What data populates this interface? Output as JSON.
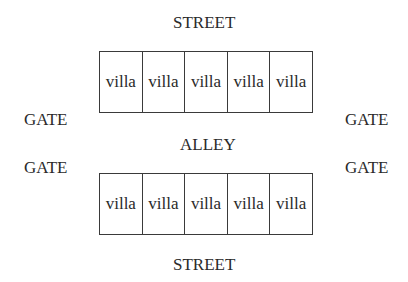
{
  "labels": {
    "street_top": "STREET",
    "street_bottom": "STREET",
    "alley": "ALLEY",
    "gate_top_left": "GATE",
    "gate_top_right": "GATE",
    "gate_bottom_left": "GATE",
    "gate_bottom_right": "GATE"
  },
  "rows": {
    "top": [
      "villa",
      "villa",
      "villa",
      "villa",
      "villa"
    ],
    "bottom": [
      "villa",
      "villa",
      "villa",
      "villa",
      "villa"
    ]
  }
}
